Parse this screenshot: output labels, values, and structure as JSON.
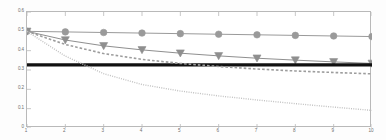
{
  "chart_data": {
    "type": "line",
    "title": "",
    "xlabel": "",
    "ylabel": "",
    "xlim": [
      1,
      10
    ],
    "ylim": [
      0,
      0.6
    ],
    "grid": false,
    "legend": "none",
    "x": [
      1,
      2,
      3,
      4,
      5,
      6,
      7,
      8,
      9,
      10
    ],
    "xticks": [
      "1",
      "2",
      "3",
      "4",
      "5",
      "6",
      "7",
      "8",
      "9",
      "10"
    ],
    "yticks": [
      "0",
      "0.1",
      "0.2",
      "0.3",
      "0.4",
      "0.5",
      "0.6"
    ],
    "ytick_values": [
      0,
      0.1,
      0.2,
      0.3,
      0.4,
      0.5,
      0.6
    ],
    "series": [
      {
        "name": "circle-marker-series",
        "marker": "circle",
        "linestyle": "solid",
        "color": "#9a9a9a",
        "values": [
          0.5,
          0.497,
          0.494,
          0.491,
          0.488,
          0.485,
          0.482,
          0.479,
          0.476,
          0.473
        ]
      },
      {
        "name": "triangle-marker-series",
        "marker": "triangle-down",
        "linestyle": "solid",
        "color": "#8f8f8f",
        "values": [
          0.5,
          0.455,
          0.425,
          0.404,
          0.387,
          0.373,
          0.361,
          0.351,
          0.342,
          0.334
        ]
      },
      {
        "name": "baseline-series",
        "marker": "none",
        "linestyle": "solid-thick",
        "color": "#111111",
        "values": [
          0.327,
          0.327,
          0.327,
          0.327,
          0.327,
          0.327,
          0.327,
          0.327,
          0.327,
          0.327
        ]
      },
      {
        "name": "dashed-series",
        "marker": "none",
        "linestyle": "dashed",
        "color": "#9d9d9d",
        "values": [
          0.5,
          0.432,
          0.385,
          0.355,
          0.334,
          0.318,
          0.305,
          0.295,
          0.287,
          0.28
        ]
      },
      {
        "name": "dotted-series",
        "marker": "none",
        "linestyle": "dotted",
        "color": "#c2c2c2",
        "values": [
          0.5,
          0.372,
          0.281,
          0.225,
          0.191,
          0.166,
          0.145,
          0.126,
          0.108,
          0.091
        ]
      }
    ]
  }
}
